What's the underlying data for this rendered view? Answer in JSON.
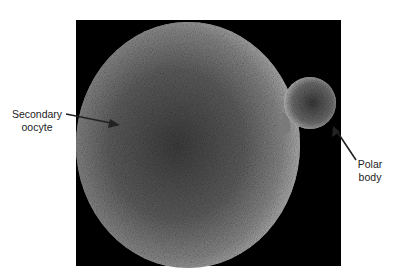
{
  "figure": {
    "type": "scanning electron micrograph",
    "colors": {
      "background": "#000000",
      "cell": "#8e8e8e",
      "label_text": "#222222"
    }
  },
  "labels": {
    "secondary_oocyte": {
      "line1": "Secondary",
      "line2": "oocyte"
    },
    "polar_body": {
      "line1": "Polar",
      "line2": "body"
    }
  }
}
